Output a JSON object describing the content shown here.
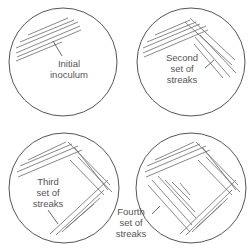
{
  "diagram": {
    "panels": [
      {
        "id": "p1",
        "label_line1": "Initial",
        "label_line2": "inoculum",
        "label_line3": ""
      },
      {
        "id": "p2",
        "label_line1": "Second",
        "label_line2": "set of",
        "label_line3": "streaks"
      },
      {
        "id": "p3",
        "label_line1": "Third",
        "label_line2": "set of",
        "label_line3": "streaks"
      },
      {
        "id": "p4",
        "label_line1": "Fourth",
        "label_line2": "set of",
        "label_line3": "streaks"
      }
    ],
    "colors": {
      "line": "#555555",
      "background": "#ffffff"
    }
  }
}
